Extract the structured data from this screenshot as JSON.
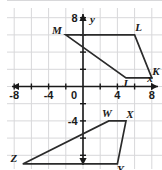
{
  "figure": {
    "title": "",
    "background_color": "#ffffff",
    "grid_color": "#d8d8da",
    "axis_color": "#1a1a1a",
    "shape_color": "#2b2b2b"
  },
  "chart_data": {
    "type": "scatter",
    "title": "",
    "xlabel": "x",
    "ylabel": "y",
    "xlim": [
      -10,
      10
    ],
    "ylim": [
      -10,
      10
    ],
    "grid": true,
    "legend": "none",
    "x_ticks": [
      -8,
      -4,
      0,
      4,
      8
    ],
    "x_tick_labels": [
      "-8",
      "-4",
      "0",
      "4",
      "8"
    ],
    "y_ticks": [
      8,
      -4
    ],
    "y_tick_labels": [
      "8",
      "-4"
    ],
    "minor_tick_step": 2,
    "origin_label": "0",
    "shapes": [
      {
        "name": "quadrilateral-MLKJ",
        "closed": true,
        "vertices": [
          {
            "label": "M",
            "x": -2,
            "y": 6,
            "label_dx": -9,
            "label_dy": -1
          },
          {
            "label": "L",
            "x": 6,
            "y": 6,
            "label_dx": 4,
            "label_dy": -4
          },
          {
            "label": "K",
            "x": 8,
            "y": 1,
            "label_dx": 4,
            "label_dy": -3
          },
          {
            "label": "J",
            "x": 5,
            "y": 1,
            "label_dx": -1,
            "label_dy": 9
          }
        ]
      },
      {
        "name": "quadrilateral-WXYZ",
        "closed": true,
        "vertices": [
          {
            "label": "W",
            "x": 3,
            "y": -4,
            "label_dx": -2,
            "label_dy": -4
          },
          {
            "label": "X",
            "x": 5,
            "y": -4,
            "label_dx": 4,
            "label_dy": -3
          },
          {
            "label": "Y",
            "x": 4,
            "y": -9,
            "label_dx": 3,
            "label_dy": 9
          },
          {
            "label": "Z",
            "x": -7,
            "y": -9,
            "label_dx": -9,
            "label_dy": -2
          }
        ]
      }
    ]
  }
}
